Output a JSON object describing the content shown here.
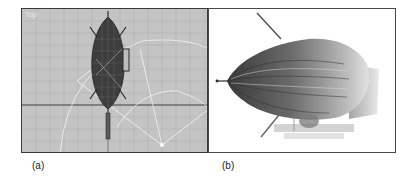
{
  "figure": {
    "panels": [
      {
        "id": "a",
        "caption": "(a)",
        "description": "3D modeling viewport, top view, wireframe airship with light cone gizmos",
        "viewport_label": "Top"
      },
      {
        "id": "b",
        "caption": "(b)",
        "description": "Rendered airship model"
      }
    ]
  }
}
